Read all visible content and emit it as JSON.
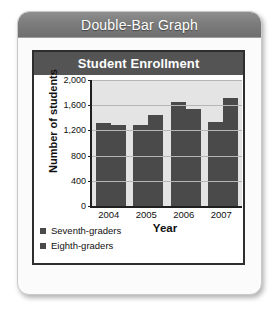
{
  "card": {
    "header_title": "Double-Bar Graph"
  },
  "chart_data": {
    "type": "bar",
    "title": "Student Enrollment",
    "xlabel": "Year",
    "ylabel": "Number of students",
    "categories": [
      "2004",
      "2005",
      "2006",
      "2007"
    ],
    "series": [
      {
        "name": "Seventh-graders",
        "values": [
          1320,
          1280,
          1650,
          1340
        ],
        "color": "#4a4a4a"
      },
      {
        "name": "Eighth-graders",
        "values": [
          1290,
          1440,
          1540,
          1710
        ],
        "color": "#4a4a4a"
      }
    ],
    "ylim": [
      0,
      2000
    ],
    "yticks": [
      "0",
      "400",
      "800",
      "1,200",
      "1,600",
      "2,000"
    ],
    "ytick_values": [
      0,
      400,
      800,
      1200,
      1600,
      2000
    ],
    "grid": true,
    "legend_position": "below-left"
  }
}
